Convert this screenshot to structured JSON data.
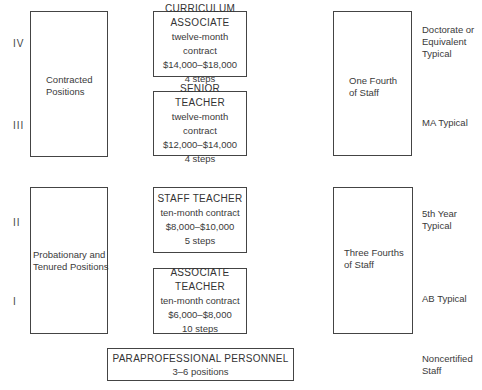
{
  "ranks": [
    "IV",
    "III",
    "II",
    "I"
  ],
  "groups": {
    "contracted": "Contracted\nPositions",
    "probationary": "Probationary and\nTenured Positions"
  },
  "positions": [
    {
      "title": "CURRICULUM ASSOCIATE",
      "contract": "twelve-month contract",
      "salary": "$14,000–$18,000",
      "steps": "4 steps"
    },
    {
      "title": "SENIOR TEACHER",
      "contract": "twelve-month contract",
      "salary": "$12,000–$14,000",
      "steps": "4 steps"
    },
    {
      "title": "STAFF TEACHER",
      "contract": "ten-month contract",
      "salary": "$8,000–$10,000",
      "steps": "5 steps"
    },
    {
      "title": "ASSOCIATE TEACHER",
      "contract": "ten-month contract",
      "salary": "$6,000–$8,000",
      "steps": "10 steps"
    }
  ],
  "paraprofessional": {
    "title": "PARAPROFESSIONAL PERSONNEL",
    "count": "3–6 positions"
  },
  "staff_share": {
    "upper": "One Fourth\nof Staff",
    "lower": "Three Fourths\nof Staff"
  },
  "qualifications": {
    "iv": "Doctorate or\nEquivalent\nTypical",
    "iii": "MA Typical",
    "ii": "5th Year\nTypical",
    "i": "AB Typical",
    "noncert": "Noncertified\nStaff"
  }
}
